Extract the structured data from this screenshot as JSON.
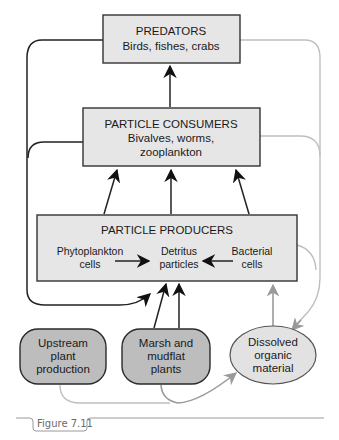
{
  "nodes": {
    "predators": {
      "title": "PREDATORS",
      "subtitle": "Birds, fishes, crabs"
    },
    "consumers": {
      "title": "PARTICLE CONSUMERS",
      "subtitle_line1": "Bivalves, worms,",
      "subtitle_line2": "zooplankton"
    },
    "producers": {
      "title": "PARTICLE PRODUCERS",
      "phytoplankton": {
        "line1": "Phytoplankton",
        "line2": "cells"
      },
      "detritus": {
        "line1": "Detritus",
        "line2": "particles"
      },
      "bacterial": {
        "line1": "Bacterial",
        "line2": "cells"
      }
    },
    "upstream": {
      "line1": "Upstream",
      "line2": "plant",
      "line3": "production"
    },
    "marsh": {
      "line1": "Marsh and",
      "line2": "mudflat",
      "line3": "plants"
    },
    "dissolved": {
      "line1": "Dissolved",
      "line2": "organic",
      "line3": "material"
    }
  },
  "caption": {
    "label": "Figure 7.11"
  },
  "colors": {
    "box_fill": "#e6e6e6",
    "pill_fill": "#bdbdbd",
    "ellipse_fill": "#e2e2e2",
    "dark_flow": "#222222",
    "light_flow": "#bfbfbf",
    "gray_flow": "#9a9a9a"
  }
}
